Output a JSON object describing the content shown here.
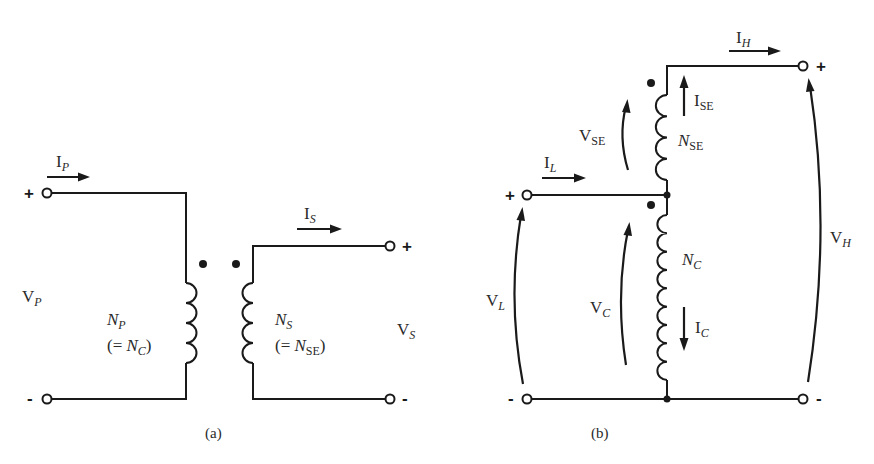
{
  "diagram": {
    "panel_a": {
      "caption": "(a)",
      "primary_current": {
        "main": "I",
        "sub": "P"
      },
      "secondary_current": {
        "main": "I",
        "sub": "S"
      },
      "primary_voltage": {
        "main": "V",
        "sub": "P"
      },
      "secondary_voltage": {
        "main": "V",
        "sub": "S"
      },
      "primary_turns": {
        "main": "N",
        "sub": "P",
        "equiv_prefix": "(= ",
        "equiv_main": "N",
        "equiv_sub": "C",
        "equiv_suffix": ")"
      },
      "secondary_turns": {
        "main": "N",
        "sub": "S",
        "equiv_prefix": "(= ",
        "equiv_main": "N",
        "equiv_sub": "SE",
        "equiv_suffix": ")"
      },
      "primary_coil_turns": 4,
      "secondary_coil_turns": 4,
      "plus_sign": "+",
      "minus_sign": "-"
    },
    "panel_b": {
      "caption": "(b)",
      "high_current": {
        "main": "I",
        "sub": "H"
      },
      "low_current": {
        "main": "I",
        "sub": "L"
      },
      "series_current": {
        "main": "I",
        "sub": "SE"
      },
      "common_current": {
        "main": "I",
        "sub": "C"
      },
      "series_voltage": {
        "main": "V",
        "sub": "SE"
      },
      "common_voltage": {
        "main": "V",
        "sub": "C"
      },
      "low_voltage": {
        "main": "V",
        "sub": "L"
      },
      "high_voltage": {
        "main": "V",
        "sub": "H"
      },
      "series_turns": {
        "main": "N",
        "sub": "SE"
      },
      "common_turns": {
        "main": "N",
        "sub": "C"
      },
      "series_coil_turns": 4,
      "common_coil_turns": 9,
      "plus_sign": "+",
      "minus_sign": "-"
    }
  }
}
